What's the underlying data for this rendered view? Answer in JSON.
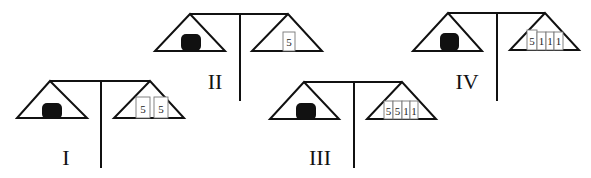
{
  "figure": {
    "scales": [
      {
        "label": "I",
        "left_pan": "black-object",
        "weights": [
          "5",
          "5"
        ]
      },
      {
        "label": "II",
        "left_pan": "black-object",
        "weights": [
          "5"
        ]
      },
      {
        "label": "III",
        "left_pan": "black-object",
        "weights": [
          "5",
          "5",
          "1",
          "1"
        ]
      },
      {
        "label": "IV",
        "left_pan": "black-object",
        "weights": [
          "5",
          "1",
          "1",
          "1"
        ]
      }
    ]
  },
  "colors": {
    "ink": "#111111",
    "background": "#ffffff",
    "weight_border": "#777777"
  }
}
